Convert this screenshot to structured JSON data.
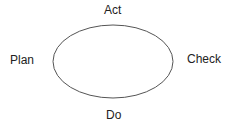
{
  "diagram": {
    "type": "cycle",
    "shape": "ellipse",
    "stroke_color": "#555555",
    "labels": {
      "top": "Act",
      "left": "Plan",
      "right": "Check",
      "bottom": "Do"
    }
  }
}
